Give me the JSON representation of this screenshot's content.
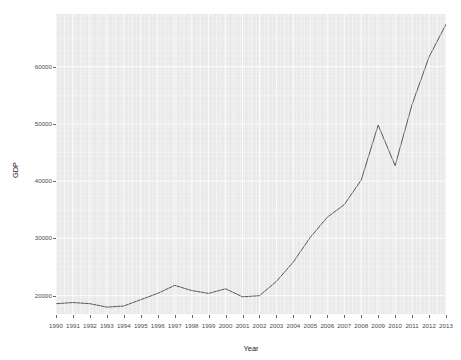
{
  "chart_data": {
    "type": "line",
    "title": "",
    "subtitle": "",
    "xlabel": "Year",
    "ylabel": "GDP",
    "grid": true,
    "legend": false,
    "legend_position": "none",
    "line_color": "#595959",
    "panel_color": "#ebebeb",
    "gridline_color": "#ffffff",
    "x": [
      1990,
      1991,
      1992,
      1993,
      1994,
      1995,
      1996,
      1997,
      1998,
      1999,
      2000,
      2001,
      2002,
      2003,
      2004,
      2005,
      2006,
      2007,
      2008,
      2009,
      2010,
      2011,
      2012,
      2013
    ],
    "categories": [
      "1990",
      "1991",
      "1992",
      "1993",
      "1994",
      "1995",
      "1996",
      "1997",
      "1998",
      "1999",
      "2000",
      "2001",
      "2002",
      "2003",
      "2004",
      "2005",
      "2006",
      "2007",
      "2008",
      "2009",
      "2010",
      "2011",
      "2012",
      "2013"
    ],
    "values": [
      18600,
      18800,
      18600,
      18000,
      18200,
      19300,
      20400,
      21800,
      20900,
      20400,
      21200,
      19800,
      20000,
      22500,
      25900,
      30200,
      33700,
      35900,
      40200,
      49800,
      42700,
      53400,
      61700,
      67400
    ],
    "series": [
      {
        "name": "GDP",
        "values": [
          18600,
          18800,
          18600,
          18000,
          18200,
          19300,
          20400,
          21800,
          20900,
          20400,
          21200,
          19800,
          20000,
          22500,
          25900,
          30200,
          33700,
          35900,
          40200,
          49800,
          42700,
          53400,
          61700,
          67400
        ]
      }
    ],
    "xlim": [
      1990,
      2013
    ],
    "ylim": [
      16800,
      69200
    ],
    "xticks": [
      1990,
      1991,
      1992,
      1993,
      1994,
      1995,
      1996,
      1997,
      1998,
      1999,
      2000,
      2001,
      2002,
      2003,
      2004,
      2005,
      2006,
      2007,
      2008,
      2009,
      2010,
      2011,
      2012,
      2013
    ],
    "xtick_labels": [
      "1990",
      "1991",
      "1992",
      "1993",
      "1994",
      "1995",
      "1996",
      "1997",
      "1998",
      "1999",
      "2000",
      "2001",
      "2002",
      "2003",
      "2004",
      "2005",
      "2006",
      "2007",
      "2008",
      "2009",
      "2010",
      "2011",
      "2012",
      "2013"
    ],
    "yticks": [
      20000,
      30000,
      40000,
      50000,
      60000
    ],
    "ytick_labels": [
      "20000",
      "30000",
      "40000",
      "50000",
      "60000"
    ],
    "minor_yticks": [
      25000,
      35000,
      45000,
      55000,
      65000
    ],
    "annotations": []
  }
}
